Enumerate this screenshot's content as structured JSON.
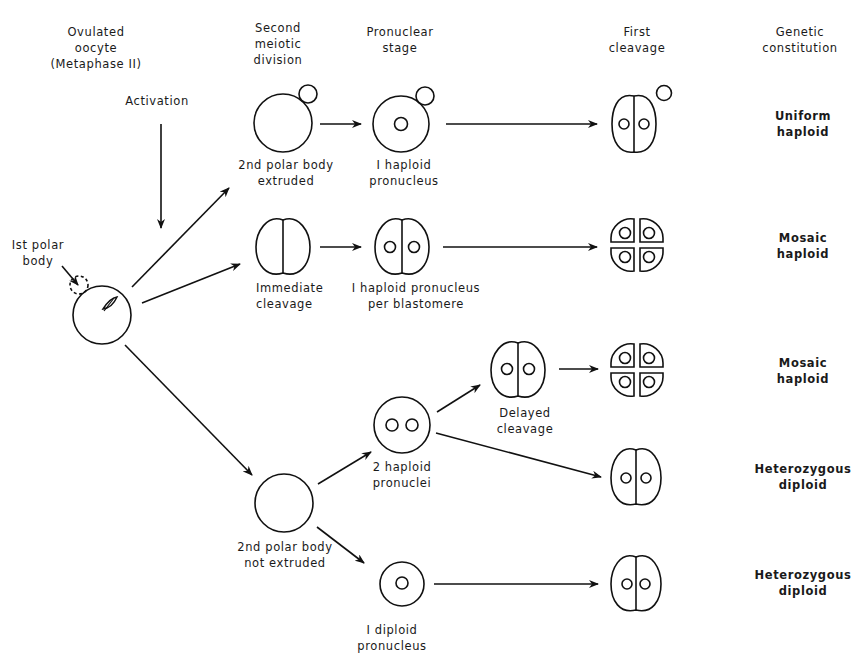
{
  "headers": {
    "oocyte": [
      "Ovulated",
      "oocyte",
      "(Metaphase II)"
    ],
    "meiotic": [
      "Second",
      "meiotic",
      "division"
    ],
    "pronuclear": [
      "Pronuclear",
      "stage"
    ],
    "cleavage": [
      "First",
      "cleavage"
    ],
    "genetic": [
      "Genetic",
      "constitution"
    ]
  },
  "activation_label": "Activation",
  "polar_body_label": [
    "Ist polar",
    "body"
  ],
  "stage_labels": {
    "extruded": [
      "2nd polar body",
      "extruded"
    ],
    "one_haploid": [
      "I haploid",
      "pronucleus"
    ],
    "immediate": [
      "Immediate",
      "cleavage"
    ],
    "per_blastomere": [
      "I haploid pronucleus",
      "per blastomere"
    ],
    "delayed": [
      "Delayed",
      "cleavage"
    ],
    "two_haploid": [
      "2 haploid",
      "pronuclei"
    ],
    "not_extruded": [
      "2nd polar body",
      "not extruded"
    ],
    "one_diploid": [
      "I diploid",
      "pronucleus"
    ]
  },
  "outcomes": [
    [
      "Uniform",
      "haploid"
    ],
    [
      "Mosaic",
      "haploid"
    ],
    [
      "Mosaic",
      "haploid"
    ],
    [
      "Heterozygous",
      "diploid"
    ],
    [
      "Heterozygous",
      "diploid"
    ]
  ],
  "colors": {
    "line": "#111111",
    "background": "#ffffff"
  }
}
